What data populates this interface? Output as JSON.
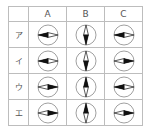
{
  "table": {
    "columns": [
      "A",
      "B",
      "C"
    ],
    "rows": [
      {
        "label": "ア",
        "cells": [
          "left",
          "down",
          "left"
        ]
      },
      {
        "label": "イ",
        "cells": [
          "left",
          "down",
          "right"
        ]
      },
      {
        "label": "ウ",
        "cells": [
          "right",
          "up",
          "left"
        ]
      },
      {
        "label": "エ",
        "cells": [
          "right",
          "up",
          "right"
        ]
      }
    ]
  },
  "legend": {
    "icon": "compass-needle-icon",
    "note": "filled half of needle indicates pointing direction"
  },
  "colors": {
    "border": "#bdbdbd",
    "needle_fill": "#111111",
    "circle": "#888888",
    "text": "#555555"
  }
}
